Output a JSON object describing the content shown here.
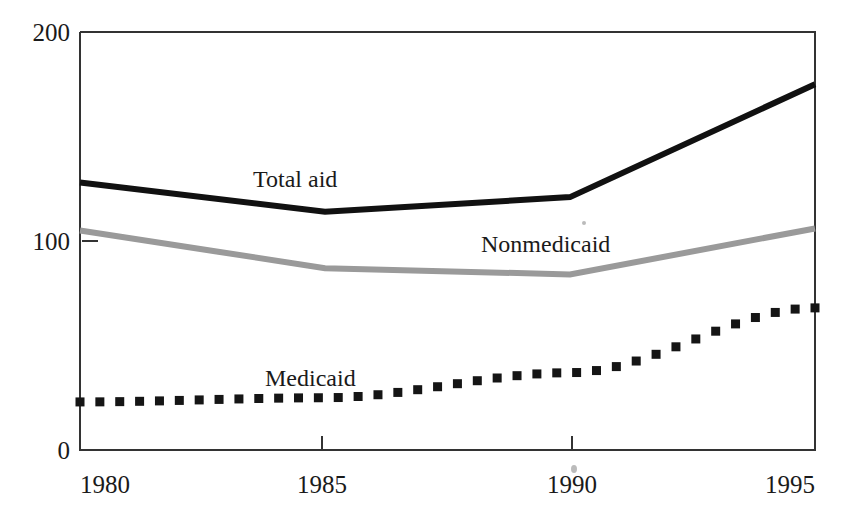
{
  "chart_data": {
    "type": "line",
    "title": "",
    "subtitle": "",
    "xlabel": "",
    "ylabel": "",
    "x": [
      1980,
      1985,
      1990,
      1995
    ],
    "categories": [
      "1980",
      "1985",
      "1990",
      "1995"
    ],
    "xlim": [
      1980,
      1995
    ],
    "ylim": [
      0,
      200
    ],
    "x_tick_labels": [
      "1980",
      "1985",
      "1990",
      "1995"
    ],
    "y_tick_labels": [
      "0",
      "100",
      "200"
    ],
    "y_ticks": [
      0,
      100,
      200
    ],
    "grid": false,
    "legend": "inline-labels",
    "series": [
      {
        "name": "Total aid",
        "label": "Total aid",
        "style": "solid-thick-black",
        "color": "#111111",
        "values": [
          128,
          114,
          121,
          175
        ]
      },
      {
        "name": "Nonmedicaid",
        "label": "Nonmedicaid",
        "style": "solid-thick-gray",
        "color": "#9a9a9a",
        "values": [
          105,
          87,
          84,
          106
        ]
      },
      {
        "name": "Medicaid",
        "label": "Medicaid",
        "style": "dotted-square-black",
        "color": "#151515",
        "values": [
          23,
          25,
          37,
          68
        ]
      }
    ],
    "annotations": [
      {
        "text": "Total aid",
        "x": 1982.4,
        "y": 143
      },
      {
        "text": "Nonmedicaid",
        "x": 1988.6,
        "y": 101
      },
      {
        "text": "Medicaid",
        "x": 1982.6,
        "y": 43
      }
    ]
  },
  "axes": {
    "y_top_label": "200",
    "y_mid_label": "100",
    "y_bottom_label": "0",
    "x_labels": [
      "1980",
      "1985",
      "1990",
      "1995"
    ]
  },
  "labels": {
    "total_aid": "Total aid",
    "nonmedicaid": "Nonmedicaid",
    "medicaid": "Medicaid"
  },
  "colors": {
    "total_aid": "#111111",
    "nonmedicaid": "#9a9a9a",
    "medicaid": "#151515",
    "frame": "#333333",
    "text": "#1a1a1a",
    "background": "#ffffff"
  }
}
